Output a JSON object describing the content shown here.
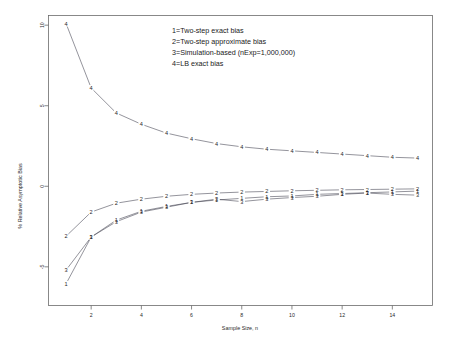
{
  "chart_data": {
    "type": "line",
    "title": "",
    "xlabel": "Sample Size, n",
    "ylabel": "% Relative Asymptotic Bias",
    "xlim": [
      0.3,
      15.6
    ],
    "ylim": [
      -7.4,
      10.6
    ],
    "xticks": [
      2,
      4,
      6,
      8,
      10,
      12,
      14
    ],
    "yticks": [
      10,
      5,
      0,
      -5
    ],
    "grid": false,
    "legend_position": "upper-center",
    "point_marker_style": "series-number-glyph",
    "x": [
      1,
      2,
      3,
      4,
      5,
      6,
      7,
      8,
      9,
      10,
      11,
      12,
      13,
      14,
      15
    ],
    "series": [
      {
        "name": "1",
        "label": "1=Two-step exact bias",
        "legend_key": "1",
        "values": [
          -6.05,
          -3.15,
          -2.1,
          -1.55,
          -1.25,
          -1.0,
          -0.85,
          -0.75,
          -0.65,
          -0.6,
          -0.5,
          -0.45,
          -0.4,
          -0.35,
          -0.3
        ]
      },
      {
        "name": "2",
        "label": "2=Two-step approximate bias",
        "legend_key": "2",
        "values": [
          -3.1,
          -1.6,
          -1.05,
          -0.8,
          -0.62,
          -0.5,
          -0.42,
          -0.36,
          -0.32,
          -0.28,
          -0.25,
          -0.22,
          -0.2,
          -0.18,
          -0.16
        ]
      },
      {
        "name": "3",
        "label": "3=Simulation-based (nExp=1,000,000)",
        "legend_key": "3",
        "values": [
          -5.2,
          -3.15,
          -2.2,
          -1.6,
          -1.3,
          -1.0,
          -0.8,
          -0.95,
          -0.8,
          -0.7,
          -0.62,
          -0.5,
          -0.42,
          -0.5,
          -0.55
        ]
      },
      {
        "name": "4",
        "label": "4=LB exact bias",
        "legend_key": "4",
        "values": [
          10.1,
          6.1,
          4.55,
          3.85,
          3.3,
          2.95,
          2.65,
          2.45,
          2.3,
          2.2,
          2.1,
          2.0,
          1.9,
          1.8,
          1.75
        ]
      }
    ]
  },
  "legend": {
    "entries": [
      "1=Two-step exact bias",
      "2=Two-step approximate bias",
      "3=Simulation-based (nExp=1,000,000)",
      "4=LB exact bias"
    ]
  },
  "axes": {
    "x_title": "Sample Size, n",
    "y_title": "% Relative Asymptotic Bias",
    "x_tick_labels": [
      "2",
      "4",
      "6",
      "8",
      "10",
      "12",
      "14"
    ],
    "y_tick_labels": [
      "10",
      "5",
      "0",
      "-5"
    ]
  },
  "style": {
    "background": "#ffffff",
    "frame_color": "#6b6b6b",
    "line_color": "#3a3a4a",
    "text_color": "#1a1a1a"
  }
}
